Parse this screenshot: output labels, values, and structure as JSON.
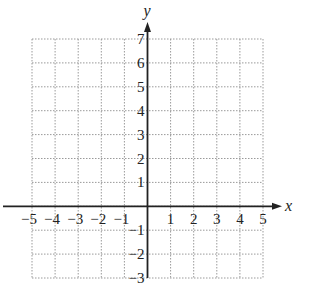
{
  "chart_data": {
    "type": "scatter",
    "title": "",
    "xlabel": "x",
    "ylabel": "y",
    "xlim": [
      -5,
      5
    ],
    "ylim": [
      -3,
      7
    ],
    "grid": true,
    "grid_style": "dotted",
    "x_ticks": [
      "-5",
      "-4",
      "-3",
      "-2",
      "-1",
      "1",
      "2",
      "3",
      "4",
      "5"
    ],
    "y_ticks": [
      "7",
      "6",
      "5",
      "4",
      "3",
      "2",
      "1",
      "-1",
      "-2",
      "-3"
    ],
    "series": []
  },
  "colors": {
    "axis": "#222222",
    "grid": "#9a9a9a",
    "background": "#ffffff"
  }
}
